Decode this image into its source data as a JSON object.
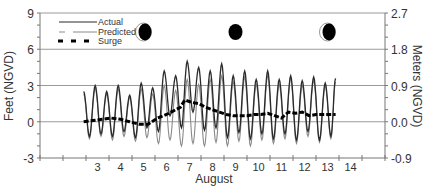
{
  "chart_data": {
    "type": "line",
    "title": "",
    "xlabel": "August",
    "ylabel": "Feet (NGVD)",
    "ylabel_right": "Meters (NGVD)",
    "ylim": [
      -3,
      9
    ],
    "ylim_right": [
      -0.9,
      2.7
    ],
    "yticks": [
      "-3",
      "0",
      "3",
      "6",
      "9"
    ],
    "yticks_right": [
      "-0.9",
      "0.0",
      "0.9",
      "1.8",
      "2.7"
    ],
    "x_range_days": [
      1,
      16
    ],
    "xtick_labels": [
      "3",
      "4",
      "5",
      "6",
      "7",
      "8",
      "9",
      "10",
      "11",
      "12",
      "13",
      "14"
    ],
    "grid": "horizontal",
    "legend": {
      "position": "upper left",
      "entries": [
        "Actual",
        "Predicted",
        "Surge"
      ]
    },
    "moon_phases": [
      {
        "day": 5.5,
        "phase": "waxing-crescent-shaded"
      },
      {
        "day": 9.5,
        "phase": "new-moon"
      },
      {
        "day": 13.5,
        "phase": "waxing-crescent-shaded"
      }
    ],
    "series": [
      {
        "name": "Actual",
        "style": "solid-dark",
        "x": [
          2.9,
          3.15,
          3.4,
          3.65,
          3.9,
          4.15,
          4.4,
          4.65,
          4.9,
          5.15,
          5.4,
          5.65,
          5.9,
          6.15,
          6.4,
          6.65,
          6.9,
          7.15,
          7.4,
          7.65,
          7.9,
          8.15,
          8.4,
          8.65,
          8.9,
          9.15,
          9.4,
          9.65,
          9.9,
          10.15,
          10.4,
          10.65,
          10.9,
          11.15,
          11.4,
          11.65,
          11.9,
          12.15,
          12.4,
          12.65,
          12.9,
          13.15,
          13.4,
          13.65,
          13.85
        ],
        "values": [
          2.5,
          -1.2,
          3.0,
          -1.0,
          2.5,
          -1.2,
          3.0,
          -0.8,
          2.2,
          -1.3,
          3.2,
          -0.5,
          2.8,
          -0.8,
          4.2,
          0.5,
          3.8,
          -0.5,
          5.0,
          0.8,
          4.5,
          -0.7,
          4.2,
          -0.5,
          4.8,
          -1.3,
          3.8,
          -0.9,
          4.2,
          -1.4,
          3.5,
          -1.0,
          4.2,
          -1.4,
          3.5,
          -1.0,
          3.8,
          -1.5,
          3.4,
          -0.8,
          3.7,
          -1.5,
          3.2,
          -1.2,
          3.6
        ]
      },
      {
        "name": "Predicted",
        "style": "solid-light",
        "x": [
          2.9,
          3.15,
          3.4,
          3.65,
          3.9,
          4.15,
          4.4,
          4.65,
          4.9,
          5.15,
          5.4,
          5.65,
          5.9,
          6.15,
          6.4,
          6.65,
          6.9,
          7.15,
          7.4,
          7.65,
          7.9,
          8.15,
          8.4,
          8.65,
          8.9,
          9.15,
          9.4,
          9.65,
          9.9,
          10.15,
          10.4,
          10.65,
          10.9,
          11.15,
          11.4,
          11.65,
          11.9,
          12.15,
          12.4,
          12.65,
          12.9,
          13.15,
          13.4,
          13.65,
          13.85
        ],
        "values": [
          2.3,
          -1.4,
          2.8,
          -1.2,
          2.3,
          -1.5,
          2.7,
          -1.2,
          2.0,
          -1.6,
          2.7,
          -1.3,
          2.3,
          -1.8,
          3.0,
          -1.5,
          2.6,
          -2.0,
          3.5,
          -1.8,
          3.1,
          -2.0,
          3.5,
          -1.7,
          3.8,
          -2.0,
          3.3,
          -1.6,
          3.7,
          -2.0,
          3.1,
          -1.5,
          3.8,
          -1.8,
          3.1,
          -1.4,
          3.6,
          -1.8,
          3.0,
          -1.2,
          3.4,
          -1.7,
          3.0,
          -1.4,
          3.3
        ]
      },
      {
        "name": "Surge",
        "style": "dashed-bold",
        "x": [
          2.9,
          3.3,
          3.7,
          4.1,
          4.5,
          4.9,
          5.3,
          5.7,
          6.1,
          6.5,
          6.9,
          7.1,
          7.3,
          7.6,
          7.9,
          8.2,
          8.5,
          8.8,
          9.1,
          9.4,
          9.7,
          10.0,
          10.3,
          10.6,
          10.9,
          11.2,
          11.5,
          11.8,
          12.1,
          12.4,
          12.7,
          13.0,
          13.3,
          13.6,
          13.85
        ],
        "values": [
          0.0,
          0.1,
          0.2,
          0.3,
          0.2,
          0.0,
          -0.2,
          -0.2,
          0.3,
          0.6,
          1.0,
          1.2,
          1.8,
          1.6,
          1.5,
          1.2,
          1.0,
          0.8,
          0.6,
          0.5,
          0.5,
          0.5,
          0.6,
          0.6,
          0.7,
          0.5,
          0.3,
          0.8,
          0.7,
          0.8,
          0.5,
          0.6,
          0.6,
          0.6,
          0.6
        ]
      }
    ]
  },
  "colors": {
    "actual": "#2b2b2b",
    "predicted": "#8a8a8a",
    "surge": "#000000",
    "grid": "#9a9a9a",
    "axis": "#777777",
    "text": "#333333"
  }
}
